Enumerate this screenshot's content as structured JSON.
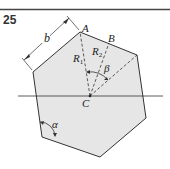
{
  "problem_number": "25",
  "labels": {
    "vertex_a": "A",
    "point_b": "B",
    "center_c": "C",
    "side_b": "b",
    "radius_1": "R",
    "radius_1_sub": "1",
    "radius_2": "R",
    "radius_2_sub": "2",
    "angle_alpha": "α",
    "angle_beta": "β"
  },
  "colors": {
    "fill": "#e6e6e6",
    "stroke": "#333333",
    "rule": "#444444"
  }
}
